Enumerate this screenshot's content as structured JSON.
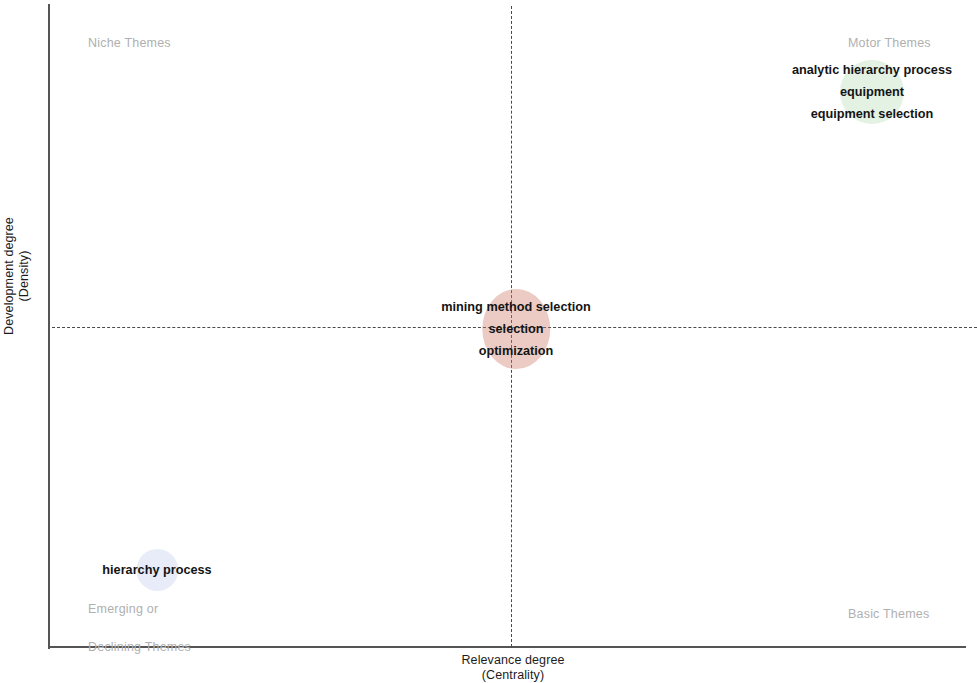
{
  "chart_data": {
    "type": "scatter",
    "title": "",
    "xlabel": "Relevance degree\n(Centrality)",
    "ylabel": "Development degree\n(Density)",
    "axes": {
      "x_title_line1": "Relevance degree",
      "x_title_line2": "(Centrality)",
      "y_title_line1": "Development degree",
      "y_title_line2": "(Density)",
      "x_divider": "dashed vertical at mid-centrality",
      "y_divider": "dashed horizontal at mid-density",
      "grid": false,
      "legend": "none"
    },
    "quadrants": [
      {
        "id": "niche",
        "label": "Niche Themes",
        "position": "top-left",
        "color": "#b0b0b0"
      },
      {
        "id": "motor",
        "label": "Motor Themes",
        "position": "top-right",
        "color": "#b0b0b0"
      },
      {
        "id": "emerging",
        "label": "Emerging or\nDeclining Themes",
        "position": "bottom-left",
        "color": "#b0b0b0"
      },
      {
        "id": "basic",
        "label": "Basic Themes",
        "position": "bottom-right",
        "color": "#b0b0b0"
      }
    ],
    "clusters": [
      {
        "id": "motor-themes",
        "quadrant": "motor",
        "terms": [
          "analytic hierarchy process",
          "equipment",
          "equipment selection"
        ],
        "bubble_color": "#78be78",
        "x_rel": 0.92,
        "y_rel": 0.86
      },
      {
        "id": "basic-core",
        "quadrant": "center",
        "terms": [
          "mining method selection",
          "selection",
          "optimization"
        ],
        "bubble_color": "#ce7c68",
        "x_rel": 0.51,
        "y_rel": 0.5
      },
      {
        "id": "emerging",
        "quadrant": "emerging",
        "terms": [
          "hierarchy process"
        ],
        "bubble_color": "#96aae1",
        "x_rel": 0.12,
        "y_rel": 0.12
      }
    ]
  },
  "axes": {
    "y_title_line1": "Development degree",
    "y_title_line2": "(Density)",
    "x_title_line1": "Relevance degree",
    "x_title_line2": "(Centrality)"
  },
  "quadrants": {
    "niche": "Niche Themes",
    "motor": "Motor Themes",
    "emerging_line1": "Emerging or",
    "emerging_line2": "Declining Themes",
    "basic": "Basic Themes"
  },
  "clusters": {
    "motor": {
      "term1": "analytic hierarchy process",
      "term2": "equipment",
      "term3": "equipment selection"
    },
    "core": {
      "term1": "mining method selection",
      "term2": "selection",
      "term3": "optimization"
    },
    "emerging": {
      "term1": "hierarchy process"
    }
  }
}
